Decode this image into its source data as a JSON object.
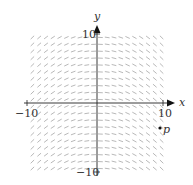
{
  "chart_data": {
    "type": "slope-field",
    "title": "",
    "xlabel": "x",
    "ylabel": "y",
    "xlim": [
      -10,
      10
    ],
    "ylim": [
      -10,
      10
    ],
    "x_tick_labels": [
      "-10",
      "10"
    ],
    "y_tick_labels": [
      "10",
      "-10"
    ],
    "grid": false,
    "field": {
      "description": "Slopes depend only on x: positive for x<0, zero at x=0, negative for x>0",
      "approx_equation": "dy/dx = -0.1x",
      "x_range": [
        -9.5,
        9.5
      ],
      "y_range": [
        -9.5,
        9.5
      ],
      "step": 1
    },
    "points": [
      {
        "label": "p",
        "x": 9.5,
        "y": -3.7
      }
    ]
  },
  "labels": {
    "x_axis": "x",
    "y_axis": "y",
    "x_min": "−10",
    "x_max": "10",
    "y_max": "10",
    "y_min": "−10",
    "point": "p"
  },
  "colors": {
    "axis": "#222222",
    "field": "#9a9a9a",
    "point": "#111111"
  }
}
